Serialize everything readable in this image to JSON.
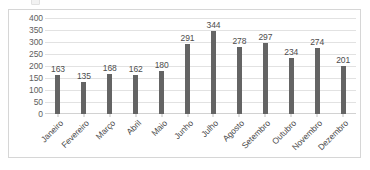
{
  "chart_data": {
    "type": "bar",
    "title": "",
    "xlabel": "",
    "ylabel": "",
    "categories": [
      "Janeiro",
      "Fevereiro",
      "Março",
      "Abril",
      "Maio",
      "Junho",
      "Julho",
      "Agosto",
      "Setembro",
      "Outubro",
      "Novembro",
      "Dezembro"
    ],
    "values": [
      163,
      135,
      168,
      162,
      180,
      291,
      344,
      278,
      297,
      234,
      274,
      201
    ],
    "series": [
      {
        "name": "",
        "values": [
          163,
          135,
          168,
          162,
          180,
          291,
          344,
          278,
          297,
          234,
          274,
          201
        ]
      }
    ],
    "ylim": [
      0,
      400
    ],
    "ytick_step": 50,
    "yticks": [
      400,
      350,
      300,
      250,
      200,
      150,
      100,
      50,
      0
    ],
    "ytick_labels": [
      "400",
      "350",
      "300",
      "250",
      "200",
      "150",
      "100",
      "50",
      "0"
    ],
    "data_labels": [
      "163",
      "135",
      "168",
      "162",
      "180",
      "291",
      "344",
      "278",
      "297",
      "234",
      "274",
      "201"
    ],
    "grid": true,
    "gridlines_axis": "y",
    "legend": false,
    "legend_position": "none",
    "xtick_label_rotation": -45,
    "colors": {
      "bar": "#646464",
      "gridline": "#e2e2e2",
      "axis_text": "#4d4d4d",
      "ytick_text": "#5e5e5e",
      "frame_border": "#d6d6d6",
      "plot_background": "#ffffff"
    }
  }
}
